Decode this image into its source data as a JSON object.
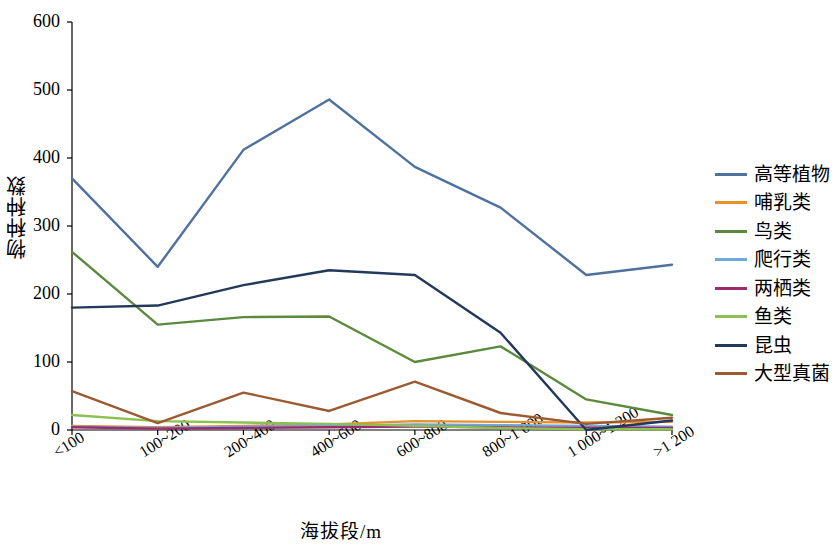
{
  "chart_data": {
    "type": "line",
    "title": "",
    "xlabel": "海拔段/m",
    "ylabel": "物种种数",
    "categories": [
      "<100",
      "100~200",
      "200~400",
      "400~600",
      "600~800",
      "800~1 000",
      "1 000~1 200",
      ">1 200"
    ],
    "ylim": [
      0,
      600
    ],
    "yticks": [
      0,
      100,
      200,
      300,
      400,
      500,
      600
    ],
    "grid": false,
    "legend_position": "right",
    "series": [
      {
        "name": "高等植物",
        "color": "#4f71a0",
        "values": [
          370,
          240,
          412,
          486,
          387,
          327,
          228,
          243
        ]
      },
      {
        "name": "哺乳类",
        "color": "#e8912b",
        "values": [
          6,
          4,
          6,
          8,
          13,
          12,
          11,
          12
        ]
      },
      {
        "name": "鸟类",
        "color": "#5b8a3c",
        "values": [
          262,
          155,
          166,
          167,
          100,
          123,
          45,
          22
        ]
      },
      {
        "name": "爬行类",
        "color": "#6fa8dc",
        "values": [
          5,
          3,
          5,
          6,
          8,
          7,
          6,
          5
        ]
      },
      {
        "name": "两栖类",
        "color": "#9e2a6e",
        "values": [
          4,
          2,
          3,
          4,
          5,
          4,
          3,
          3
        ]
      },
      {
        "name": "鱼类",
        "color": "#8cc152",
        "values": [
          22,
          13,
          11,
          9,
          6,
          3,
          1,
          1
        ]
      },
      {
        "name": "昆虫",
        "color": "#23395b",
        "values": [
          180,
          183,
          213,
          235,
          228,
          143,
          0,
          14
        ]
      },
      {
        "name": "大型真菌",
        "color": "#9c5a32",
        "values": [
          57,
          10,
          55,
          28,
          71,
          25,
          9,
          18
        ]
      }
    ]
  }
}
